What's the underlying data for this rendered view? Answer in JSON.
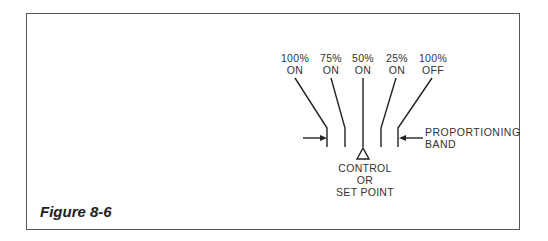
{
  "figure": {
    "caption": "Figure 8-6",
    "top_labels": [
      {
        "line1": "100%",
        "line2": "ON"
      },
      {
        "line1": "75%",
        "line2": "ON"
      },
      {
        "line1": "50%",
        "line2": "ON"
      },
      {
        "line1": "25%",
        "line2": "ON"
      },
      {
        "line1": "100%",
        "line2": "OFF"
      }
    ],
    "set_point_label": {
      "line1": "CONTROL",
      "line2": "OR",
      "line3": "SET POINT"
    },
    "band_label": {
      "line1": "PROPORTIONING",
      "line2": "BAND"
    }
  },
  "colors": {
    "line": "#222222",
    "frame": "#555555",
    "text": "#333333"
  }
}
